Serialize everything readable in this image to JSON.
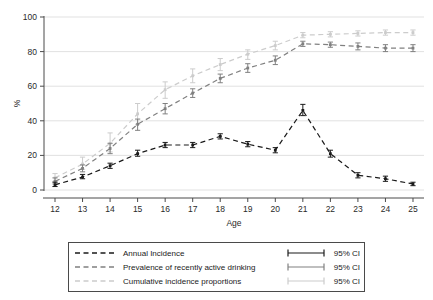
{
  "chart_data": {
    "type": "line",
    "title": "",
    "xlabel": "Age",
    "ylabel": "%",
    "x": [
      12,
      13,
      14,
      15,
      16,
      17,
      18,
      19,
      20,
      21,
      22,
      23,
      24,
      25
    ],
    "categories": [
      "12",
      "13",
      "14",
      "15",
      "16",
      "17",
      "18",
      "19",
      "20",
      "21",
      "22",
      "23",
      "24",
      "25"
    ],
    "xlim": [
      11.6,
      25.4
    ],
    "ylim": [
      0,
      100
    ],
    "yticks": [
      0,
      20,
      40,
      60,
      80,
      100
    ],
    "xticks": [
      12,
      13,
      14,
      15,
      16,
      17,
      18,
      19,
      20,
      21,
      22,
      23,
      24,
      25
    ],
    "grid": "horizontal",
    "legend_position": "bottom",
    "series": [
      {
        "name": "Annual Incidence",
        "color": "#1a1a1a",
        "style": "dashed",
        "values": [
          3,
          7.5,
          14,
          21,
          26,
          26,
          31,
          26.5,
          23,
          46,
          21,
          8.5,
          6.5,
          3.5
        ],
        "ci_low": [
          2,
          6.5,
          12.5,
          19.5,
          24.5,
          24.5,
          29.5,
          25,
          21.5,
          43,
          19,
          7,
          5,
          2.5
        ],
        "ci_high": [
          4.5,
          9,
          15.5,
          23,
          27.5,
          27.5,
          32.5,
          28,
          24.5,
          49.5,
          23,
          10,
          8,
          4.5
        ],
        "ci_label": "95% CI"
      },
      {
        "name": "Prevalence of recently active drinking",
        "color": "#808080",
        "style": "dashed",
        "values": [
          5,
          12.5,
          24,
          38,
          47,
          56,
          64.5,
          70.5,
          75,
          84.5,
          84,
          83,
          82,
          82
        ],
        "ci_low": [
          3.5,
          10.5,
          21,
          34.5,
          44,
          53.5,
          62,
          68,
          72.5,
          83,
          82.5,
          81,
          80,
          80
        ],
        "ci_high": [
          7,
          14.5,
          27,
          41,
          50,
          58.5,
          67,
          73,
          77.5,
          86,
          85.5,
          85,
          84,
          84
        ],
        "ci_label": "95% CI"
      },
      {
        "name": "Cumulative incidence proportions",
        "color": "#cccccc",
        "style": "dashed",
        "values": [
          7,
          15,
          27,
          44,
          58,
          66,
          72.5,
          78.5,
          83.5,
          89.5,
          90,
          90.5,
          91,
          91
        ],
        "ci_low": [
          5,
          12,
          22,
          38,
          53,
          62,
          69,
          75.5,
          81,
          88,
          88.5,
          89,
          89.5,
          89.5
        ],
        "ci_high": [
          9.5,
          19,
          33,
          50,
          62.5,
          70,
          76,
          81,
          86,
          91,
          91.5,
          92,
          92.5,
          92.5
        ],
        "ci_label": "95% CI"
      }
    ]
  },
  "axes": {
    "ylabel": "%",
    "xlabel": "Age",
    "ytick_labels": [
      "0",
      "20",
      "40",
      "60",
      "80",
      "100"
    ],
    "xtick_labels": [
      "12",
      "13",
      "14",
      "15",
      "16",
      "17",
      "18",
      "19",
      "20",
      "21",
      "22",
      "23",
      "24",
      "25"
    ]
  },
  "legend": {
    "rows": [
      {
        "label": "Annual Incidence",
        "ci": "95% CI",
        "color": "#1a1a1a"
      },
      {
        "label": "Prevalence of recently active drinking",
        "ci": "95% CI",
        "color": "#808080"
      },
      {
        "label": "Cumulative incidence proportions",
        "ci": "95% CI",
        "color": "#cccccc"
      }
    ]
  }
}
